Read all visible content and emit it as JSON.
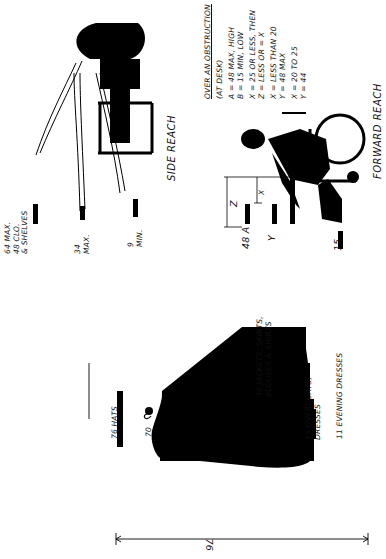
{
  "closet": {
    "overall_dimension": "76",
    "labels": [
      {
        "id": "hats",
        "text": "76 HATS"
      },
      {
        "id": "rod",
        "text": "70"
      },
      {
        "id": "jackets",
        "text": "36 JACKETS, SKIRTS,\nBLOUSES & SHIRTS"
      },
      {
        "id": "overcoats",
        "text": "15 OVERCOATS,\nDRESSES"
      },
      {
        "id": "evening",
        "text": "11 EVENING DRESSES"
      }
    ]
  },
  "side_reach": {
    "title": "SIDE REACH",
    "labels": [
      {
        "id": "max64",
        "text": "64 MAX.\n48 CLO.\n& SHELVES"
      },
      {
        "id": "max34",
        "text": "34\nMAX."
      },
      {
        "id": "min9",
        "text": "9\nMIN."
      }
    ]
  },
  "forward_reach": {
    "title": "FORWARD REACH",
    "dimension_labels": {
      "a": "48 A",
      "y": "Y",
      "b": "15",
      "z": "Z",
      "x": "X"
    },
    "notes": {
      "heading": "OVER AN OBSTRUCTION",
      "subheading": "(AT DESK)",
      "lines": [
        "A = 48 MAX, HIGH",
        "B = 15 MIN, LOW",
        "X = 25 OR LESS, THEN",
        "Z = LESS OR = X",
        "X = LESS THAN 20",
        "Y = 48 MAX",
        "X = 20 TO 25",
        "Y = 44"
      ]
    }
  },
  "colors": {
    "ink": "#000000",
    "paper": "#ffffff"
  }
}
